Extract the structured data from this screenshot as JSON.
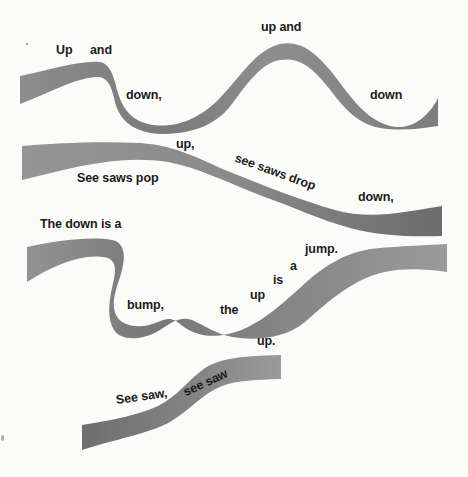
{
  "poem": {
    "lines": [
      {
        "id": "w1",
        "text": "Up"
      },
      {
        "id": "w2",
        "text": "and"
      },
      {
        "id": "w3",
        "text": "down,"
      },
      {
        "id": "w4",
        "text": "up and"
      },
      {
        "id": "w5",
        "text": "down"
      },
      {
        "id": "w6",
        "text": "up,"
      },
      {
        "id": "w7",
        "text": "See saws pop"
      },
      {
        "id": "w8",
        "text": "see saws drop"
      },
      {
        "id": "w9",
        "text": "down,"
      },
      {
        "id": "w10",
        "text": "The down is a"
      },
      {
        "id": "w11",
        "text": "jump."
      },
      {
        "id": "w12",
        "text": "a"
      },
      {
        "id": "w13",
        "text": "is"
      },
      {
        "id": "w14",
        "text": "up"
      },
      {
        "id": "w15",
        "text": "bump,"
      },
      {
        "id": "w16",
        "text": "the"
      },
      {
        "id": "w17",
        "text": "up."
      },
      {
        "id": "w18",
        "text": "See saw,"
      },
      {
        "id": "w19",
        "text": "see saw"
      }
    ]
  },
  "colors": {
    "ribbon": "#8a8a8a",
    "ribbon_dark": "#6f6f6f",
    "background": "#fbfbfa",
    "text": "#1b1b1b"
  }
}
